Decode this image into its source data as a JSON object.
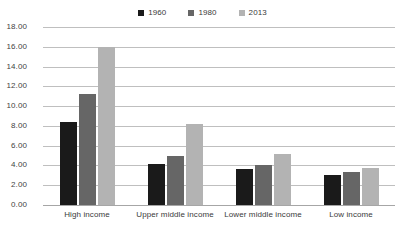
{
  "chart_data": {
    "type": "bar",
    "title": "",
    "xlabel": "",
    "ylabel": "",
    "ylim": [
      0,
      18
    ],
    "ytick_step": 2,
    "grid": true,
    "legend_position": "top-center",
    "categories": [
      "High income",
      "Upper middle income",
      "Lower middle income",
      "Low income"
    ],
    "ytick_labels": [
      "18.00",
      "16.00",
      "14.00",
      "12.00",
      "10.00",
      "8.00",
      "6.00",
      "4.00",
      "2.00",
      "0.00"
    ],
    "series": [
      {
        "name": "1960",
        "color": "#1a1a1a",
        "values": [
          8.4,
          4.1,
          3.6,
          3.0
        ]
      },
      {
        "name": "1980",
        "color": "#666666",
        "values": [
          11.25,
          5.0,
          4.0,
          3.3
        ]
      },
      {
        "name": "2013",
        "color": "#b3b3b3",
        "values": [
          16.0,
          8.2,
          5.2,
          3.7
        ]
      }
    ]
  }
}
